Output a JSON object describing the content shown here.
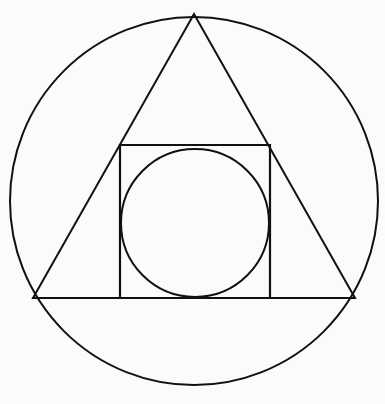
{
  "figure": {
    "canvas": {
      "width": 385,
      "height": 404
    },
    "background_color": "#fbfbfb",
    "stroke_color": "#111111"
  },
  "chart_data": {
    "type": "scatter",
    "subtitle": "",
    "xlabel": "",
    "ylabel": "",
    "xlim": [
      0,
      385
    ],
    "ylim": [
      0,
      404
    ],
    "grid": false,
    "legend": "none",
    "annotations": [],
    "shapes": [
      {
        "name": "outer-circle",
        "kind": "circle",
        "cx": 194,
        "cy": 201,
        "r": 184,
        "stroke": "#111111",
        "stroke_width": 2.0,
        "fill": "none",
        "role": "circumscribed circle enclosing the whole figure"
      },
      {
        "name": "triangle",
        "kind": "polygon",
        "points": "194,14 355,298 33,298",
        "vertices": [
          {
            "label": "apex",
            "x": 194,
            "y": 14
          },
          {
            "label": "bottom-right",
            "x": 355,
            "y": 298
          },
          {
            "label": "bottom-left",
            "x": 33,
            "y": 298
          }
        ],
        "stroke": "#111111",
        "stroke_width": 2.0,
        "fill": "none",
        "role": "triangle inscribed in the outer circle"
      },
      {
        "name": "square",
        "kind": "rect",
        "x": 120,
        "y": 145,
        "width": 150,
        "height": 153,
        "stroke": "#111111",
        "stroke_width": 2.2,
        "fill": "none",
        "role": "square resting on the triangle base, upper corners on the triangle sides"
      },
      {
        "name": "inner-circle",
        "kind": "circle",
        "cx": 195,
        "cy": 223,
        "r": 74,
        "stroke": "#111111",
        "stroke_width": 2.0,
        "fill": "none",
        "role": "circle inscribed inside the square"
      }
    ]
  }
}
